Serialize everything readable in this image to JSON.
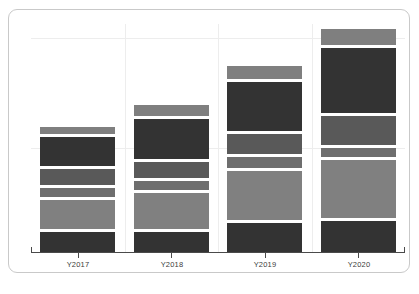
{
  "chart_data": {
    "type": "bar",
    "subtype": "stacked-bar",
    "title": "",
    "subtitle": "",
    "xlabel": "",
    "ylabel": "",
    "categories": [
      "Y2017",
      "Y2018",
      "Y2019",
      "Y2020"
    ],
    "tick_labels": [
      "Y2017",
      "Y2018",
      "Y2019",
      "Y2020"
    ],
    "ylim": [
      0,
      100
    ],
    "grid": true,
    "grid_axis": "both",
    "legend": false,
    "legend_position": "none",
    "series": [
      {
        "name": "Series 1",
        "color": "#333333",
        "values": [
          9,
          9,
          13,
          14
        ]
      },
      {
        "name": "Series 2",
        "color": "#808080",
        "values": [
          13,
          16,
          22,
          26
        ]
      },
      {
        "name": "Series 3",
        "color": "#6e6e6e",
        "values": [
          4,
          4,
          5,
          4
        ]
      },
      {
        "name": "Series 4",
        "color": "#595959",
        "values": [
          7,
          7,
          9,
          13
        ]
      },
      {
        "name": "Series 5",
        "color": "#333333",
        "values": [
          13,
          18,
          22,
          29
        ]
      },
      {
        "name": "Series 6",
        "color": "#7f7f7f",
        "values": [
          3,
          5,
          6,
          7
        ]
      }
    ],
    "totals": [
      49,
      59,
      77,
      93
    ],
    "stack_order": "bottom-to-top",
    "gap_between_segments": true,
    "segment_gap_color": "#ffffff",
    "bar_colors_by_stack_level": [
      "#333333",
      "#808080",
      "#6e6e6e",
      "#595959",
      "#333333",
      "#7f7f7f"
    ]
  },
  "panel": {
    "background": "#ffffff",
    "border_color": "#c9c9c9",
    "gridline_color": "#ededed",
    "axis_color": "#4a4a4a"
  },
  "axis": {
    "tick_label_color": "#3b3b3b"
  },
  "caption": {
    "text": ""
  }
}
